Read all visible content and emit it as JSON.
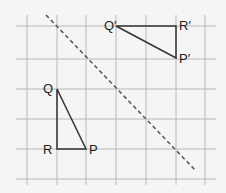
{
  "diagram": {
    "grid": {
      "x_lines": [
        27,
        57,
        86,
        116,
        146,
        176,
        205
      ],
      "y_lines": [
        26,
        59,
        89,
        119,
        149,
        179
      ],
      "x_range": [
        16,
        216
      ],
      "y_range": [
        15,
        185
      ],
      "color": "#b8b8b8"
    },
    "mirror_line": {
      "x1": 46,
      "y1": 15,
      "x2": 196,
      "y2": 171,
      "style": "dashed",
      "color": "#555555"
    },
    "triangle_original": {
      "vertices": {
        "Q": [
          57,
          89
        ],
        "R": [
          57,
          149
        ],
        "P": [
          86,
          149
        ]
      },
      "labels": {
        "Q": "Q",
        "R": "R",
        "P": "P"
      }
    },
    "triangle_image": {
      "vertices": {
        "Q": [
          116,
          26
        ],
        "R": [
          176,
          26
        ],
        "P": [
          176,
          58
        ]
      },
      "labels": {
        "Q": "Q′",
        "R": "R′",
        "P": "P′"
      }
    },
    "stroke_color": "#333333"
  }
}
